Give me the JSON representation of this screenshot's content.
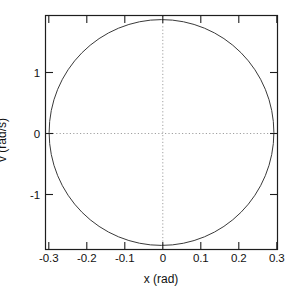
{
  "chart_data": {
    "type": "line",
    "title": "",
    "subtitle": "",
    "xlabel": "x (rad)",
    "ylabel": "v (rad/s)",
    "xlim": [
      -0.32,
      0.32
    ],
    "ylim": [
      -2.0,
      2.0
    ],
    "xticks": [
      -0.3,
      -0.2,
      -0.1,
      0,
      0.1,
      0.2,
      0.3
    ],
    "xticklabels": [
      "-0.3",
      "-0.2",
      "-0.1",
      "0",
      "0.1",
      "0.2",
      "0.3"
    ],
    "yticks": [
      1,
      0,
      -1
    ],
    "yticklabels": [
      "1",
      "0",
      "-1"
    ],
    "grid": false,
    "legend": null,
    "legend_position": "none",
    "frame": "box",
    "tick_direction": "in",
    "annotations": [],
    "reference_lines": [
      {
        "name": "v-zero-line",
        "orientation": "horizontal",
        "value": 0,
        "style": "dotted",
        "color": "#9a9a9a"
      },
      {
        "name": "x-zero-line",
        "orientation": "vertical",
        "value": 0,
        "style": "dotted",
        "color": "#9a9a9a"
      }
    ],
    "series": [
      {
        "name": "phase-trajectory",
        "description": "closed elliptical orbit in phase space",
        "color": "#3a3a3a",
        "linewidth": 1.0,
        "closed": true,
        "shape": "ellipse",
        "center": [
          0.0,
          0.0
        ],
        "semi_axis_x": 0.31,
        "semi_axis_y": 1.93,
        "x": [
          0.31,
          0.3,
          0.2827,
          0.2681,
          0.2512,
          0.2193,
          0.155,
          0.0958,
          0.0,
          -0.0958,
          -0.155,
          -0.2193,
          -0.2512,
          -0.2681,
          -0.2827,
          -0.3,
          -0.31,
          -0.3,
          -0.2827,
          -0.2681,
          -0.2512,
          -0.2193,
          -0.155,
          -0.0958,
          0.0,
          0.0958,
          0.155,
          0.2193,
          0.2512,
          0.2681,
          0.2827,
          0.3,
          0.31
        ],
        "v": [
          0.0,
          0.4896,
          0.7851,
          0.9651,
          1.1322,
          1.3647,
          1.6714,
          1.8349,
          1.93,
          1.8349,
          1.6714,
          1.3647,
          1.1322,
          0.9651,
          0.7851,
          0.4896,
          0.0,
          -0.4896,
          -0.7851,
          -0.9651,
          -1.1322,
          -1.3647,
          -1.6714,
          -1.8349,
          -1.93,
          -1.8349,
          -1.6714,
          -1.3647,
          -1.1322,
          -0.9651,
          -0.7851,
          -0.4896,
          0.0
        ]
      }
    ]
  },
  "axes": {
    "x_axis_name": "x-axis",
    "y_axis_name": "v-axis"
  }
}
